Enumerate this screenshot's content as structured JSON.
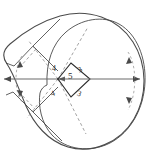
{
  "figure": {
    "canvas": {
      "width": 151,
      "height": 154,
      "background": "#ffffff"
    },
    "colors": {
      "outline": "#4a4a4a",
      "solid_line": "#3a3a3a",
      "dashed_line": "#8a8a8a",
      "axis": "#6a6a6a",
      "label_text": "#2b2b2b"
    },
    "labels": [
      {
        "id": "edge-upper-left",
        "text": "4",
        "x": 52,
        "y": 69
      },
      {
        "id": "edge-upper-right",
        "text": "3",
        "x": 77,
        "y": 70
      },
      {
        "id": "diagonal-center",
        "text": "5",
        "x": 62,
        "y": 76
      },
      {
        "id": "edge-lower-left",
        "text": "4",
        "x": 51,
        "y": 92
      },
      {
        "id": "edge-lower-right",
        "text": "3",
        "x": 76,
        "y": 92
      }
    ],
    "elements": {
      "outer_curve": "closed-egg-shaped-outline",
      "center_polygon": "rhombus-with-horizontal-diagonal",
      "horizontal_axis": "double-headed-arrow",
      "left_arc": "dashed-arc-with-arrowheads",
      "right_arc": "dashed-arc-with-arrowheads",
      "construction_lines": "dashed-and-solid-parallelograms"
    }
  }
}
